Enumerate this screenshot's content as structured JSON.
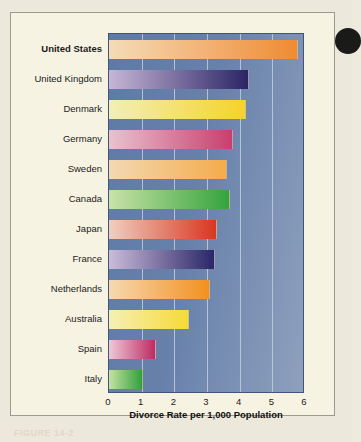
{
  "chart_data": {
    "type": "bar",
    "orientation": "horizontal",
    "title": "",
    "xlabel": "Divorce Rate per 1,000 Population",
    "ylabel": "",
    "xlim": [
      0,
      6
    ],
    "xticks": [
      "0",
      "1",
      "2",
      "3",
      "4",
      "5",
      "6"
    ],
    "grid": true,
    "legend": false,
    "highlighted_category": "United States",
    "categories": [
      "United States",
      "United Kingdom",
      "Denmark",
      "Germany",
      "Sweden",
      "Canada",
      "Japan",
      "France",
      "Netherlands",
      "Australia",
      "Spain",
      "Italy"
    ],
    "values": [
      5.8,
      4.3,
      4.2,
      3.8,
      3.6,
      3.7,
      3.3,
      3.25,
      3.1,
      2.45,
      1.45,
      1.05
    ],
    "bar_colors": [
      {
        "from": "#f5dcb9",
        "to": "#ef8b33"
      },
      {
        "from": "#c6b6d6",
        "to": "#2b2566"
      },
      {
        "from": "#f2efb8",
        "to": "#f5d329"
      },
      {
        "from": "#e8c3cf",
        "to": "#c83f6e"
      },
      {
        "from": "#f3d9b4",
        "to": "#f4ab4b"
      },
      {
        "from": "#c9e3a8",
        "to": "#35a33e"
      },
      {
        "from": "#f0cfc0",
        "to": "#d8361f"
      },
      {
        "from": "#cbbcd9",
        "to": "#2a2668"
      },
      {
        "from": "#f6d9b2",
        "to": "#f2901f"
      },
      {
        "from": "#f6f0b6",
        "to": "#f6da35"
      },
      {
        "from": "#eec9d5",
        "to": "#c02a63"
      },
      {
        "from": "#c6e2a4",
        "to": "#30a03c"
      }
    ]
  },
  "figure": {
    "plot_background": "#6881ab",
    "panel_background": "#f7f3e2",
    "gridline_color": "#c3cedd",
    "caption_artifact": "FIGURE 14-2"
  }
}
